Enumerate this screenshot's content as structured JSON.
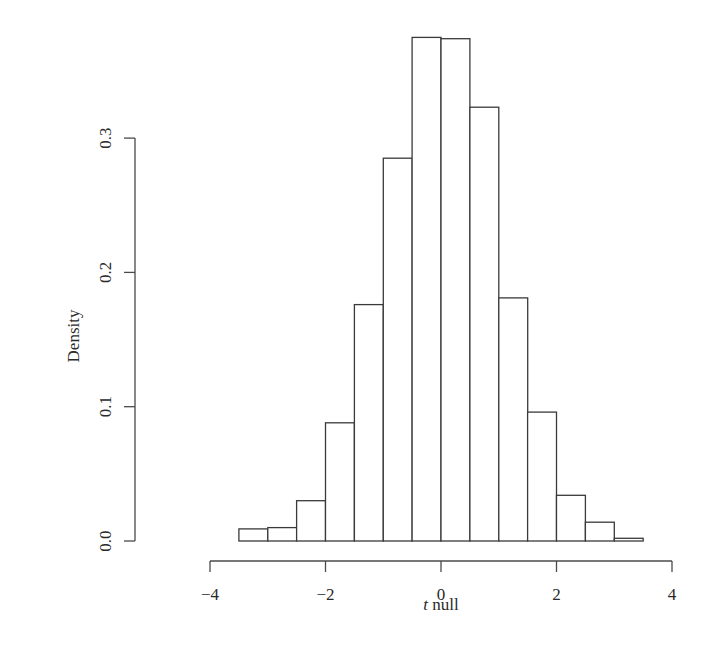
{
  "chart_data": {
    "type": "bar",
    "subtype": "histogram",
    "title": "",
    "xlabel": "t null",
    "xlabel_italic_part": "t",
    "xlabel_rest": " null",
    "ylabel": "Density",
    "xlim": [
      -4,
      4
    ],
    "ylim": [
      0,
      0.3
    ],
    "x_ticks": [
      -4,
      -2,
      0,
      2,
      4
    ],
    "x_tick_labels": [
      "−4",
      "−2",
      "0",
      "2",
      "4"
    ],
    "y_ticks": [
      0.0,
      0.1,
      0.2,
      0.3
    ],
    "y_tick_labels": [
      "0.0",
      "0.1",
      "0.2",
      "0.3"
    ],
    "grid": false,
    "legend": null,
    "bin_width": 0.5,
    "bins": [
      {
        "left": -3.5,
        "right": -3.0,
        "density": 0.009
      },
      {
        "left": -3.0,
        "right": -2.5,
        "density": 0.01
      },
      {
        "left": -2.5,
        "right": -2.0,
        "density": 0.03
      },
      {
        "left": -2.0,
        "right": -1.5,
        "density": 0.088
      },
      {
        "left": -1.5,
        "right": -1.0,
        "density": 0.176
      },
      {
        "left": -1.0,
        "right": -0.5,
        "density": 0.285
      },
      {
        "left": -0.5,
        "right": 0.0,
        "density": 0.375
      },
      {
        "left": 0.0,
        "right": 0.5,
        "density": 0.374
      },
      {
        "left": 0.5,
        "right": 1.0,
        "density": 0.323
      },
      {
        "left": 1.0,
        "right": 1.5,
        "density": 0.181
      },
      {
        "left": 1.5,
        "right": 2.0,
        "density": 0.096
      },
      {
        "left": 2.0,
        "right": 2.5,
        "density": 0.034
      },
      {
        "left": 2.5,
        "right": 3.0,
        "density": 0.014
      },
      {
        "left": 3.0,
        "right": 3.5,
        "density": 0.002
      }
    ],
    "categories": [
      "-3.5 to -3.0",
      "-3.0 to -2.5",
      "-2.5 to -2.0",
      "-2.0 to -1.5",
      "-1.5 to -1.0",
      "-1.0 to -0.5",
      "-0.5 to 0.0",
      "0.0 to 0.5",
      "0.5 to 1.0",
      "1.0 to 1.5",
      "1.5 to 2.0",
      "2.0 to 2.5",
      "2.5 to 3.0",
      "3.0 to 3.5"
    ],
    "values": [
      0.009,
      0.01,
      0.03,
      0.088,
      0.176,
      0.285,
      0.375,
      0.374,
      0.323,
      0.181,
      0.096,
      0.034,
      0.014,
      0.002
    ],
    "colors": {
      "bar_fill": "#ffffff",
      "bar_stroke": "#3a3a3a",
      "axis": "#4a4a4a",
      "text": "#2a2a2a"
    }
  }
}
